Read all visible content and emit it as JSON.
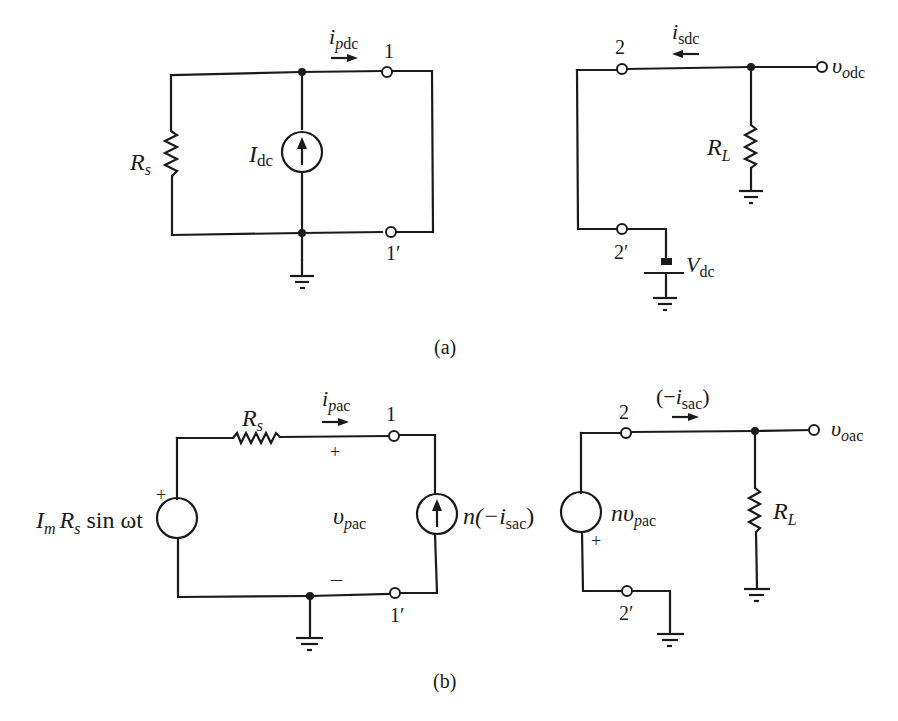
{
  "figure": {
    "caption_a": "(a)",
    "caption_b": "(b)"
  },
  "circuit_a_primary": {
    "resistor_label": "R",
    "resistor_sub": "s",
    "source_label": "I",
    "source_sub": "dc",
    "current_label": "i",
    "current_sub": "pdc",
    "terminal_top": "1",
    "terminal_bottom": "1′"
  },
  "circuit_a_secondary": {
    "terminal_top": "2",
    "terminal_bottom": "2′",
    "current_label": "i",
    "current_sub": "sdc",
    "output_label": "υ",
    "output_sub": "odc",
    "load_label": "R",
    "load_sub": "L",
    "battery_label": "V",
    "battery_sub": "dc"
  },
  "circuit_b_primary": {
    "resistor_label": "R",
    "resistor_sub": "s",
    "source_I": "I",
    "source_I_sub": "m",
    "source_R": "R",
    "source_R_sub": "s",
    "source_rest": " sin ωt",
    "source_plus": "+",
    "current_label": "i",
    "current_sub": "pac",
    "terminal_top": "1",
    "terminal_bottom": "1′",
    "voltage_label": "υ",
    "voltage_sub": "pac",
    "voltage_plus": "+",
    "voltage_minus": "–",
    "dep_source_pre": "n(−",
    "dep_source_i": "i",
    "dep_source_sub": "sac",
    "dep_source_post": ")"
  },
  "circuit_b_secondary": {
    "terminal_top": "2",
    "terminal_bottom": "2′",
    "current_pre": "(−",
    "current_i": "i",
    "current_sub": "sac",
    "current_post": ")",
    "source_n": "n",
    "source_v": "υ",
    "source_sub": "pac",
    "source_plus": "+",
    "output_label": "υ",
    "output_sub": "oac",
    "load_label": "R",
    "load_sub": "L"
  }
}
